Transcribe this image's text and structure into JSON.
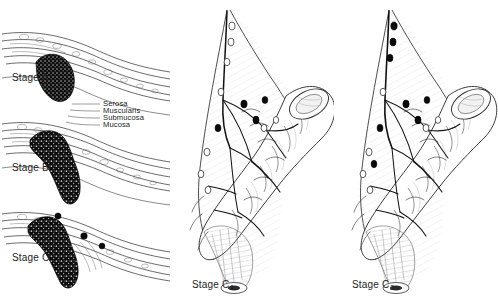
{
  "figure": {
    "background_color": "#ffffff",
    "ink_color": "#1a1a1a",
    "tumor_color": "#111111"
  },
  "left_panel": {
    "name": "bowel-wall-cross-sections",
    "stages": [
      {
        "id": "A",
        "label": "Stage A",
        "description": "Tumor confined to mucosa and submucosa"
      },
      {
        "id": "B",
        "label": "Stage B",
        "description": "Tumor penetrates muscularis into serosa"
      },
      {
        "id": "C",
        "label": "Stage C",
        "description": "Tumor with regional lymph node involvement"
      }
    ],
    "wall_layers": [
      {
        "label": "Serosa"
      },
      {
        "label": "Muscularis"
      },
      {
        "label": "Submucosa"
      },
      {
        "label": "Mucosa"
      }
    ]
  },
  "mid_panel": {
    "name": "stage-c1-mesentery",
    "label": "Stage C",
    "subscript": "1",
    "involved_nodes": "distal pericolic nodes only",
    "apical_nodes": "uninvolved"
  },
  "right_panel": {
    "name": "stage-c2-mesentery",
    "label": "Stage C",
    "subscript": "2",
    "involved_nodes": "nodes up to the point of ligation",
    "apical_nodes": "involved"
  }
}
